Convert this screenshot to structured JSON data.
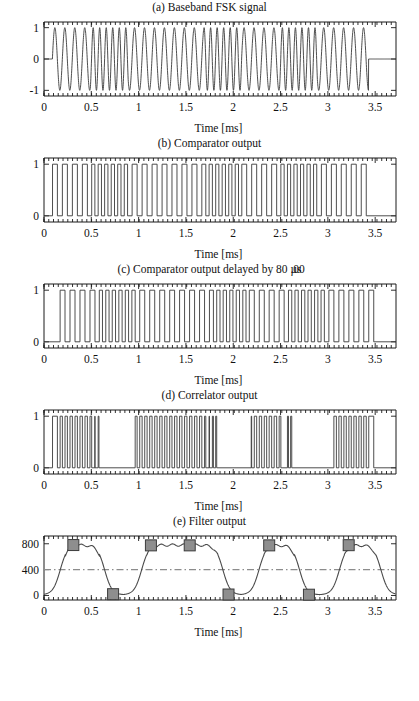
{
  "figure": {
    "xlabel": "Time [ms]",
    "x_ticks": [
      "0",
      "0.5",
      "1",
      "1.5",
      "2",
      "2.5",
      "3",
      "3.5"
    ],
    "x_tick_values": [
      0,
      0.5,
      1,
      1.5,
      2,
      2.5,
      3,
      3.5
    ],
    "x_range": [
      0,
      3.72
    ]
  },
  "panels": {
    "a": {
      "title": "(a) Baseband FSK signal",
      "y_ticks": [
        "1",
        "0",
        "-1"
      ],
      "y_tick_values": [
        1,
        0,
        -1
      ],
      "y_range": [
        -1.18,
        1.18
      ]
    },
    "b": {
      "title": "(b) Comparator output",
      "y_ticks": [
        "1",
        "0"
      ],
      "y_tick_values": [
        1,
        0
      ],
      "y_range": [
        -0.12,
        1.12
      ]
    },
    "c": {
      "title_main": "(c) Comparator output delayed by 80 ",
      "title_overlap_top": "µs",
      "title_overlap_under": ".00",
      "y_ticks": [
        "1",
        "0"
      ],
      "y_tick_values": [
        1,
        0
      ],
      "y_range": [
        -0.12,
        1.12
      ]
    },
    "d": {
      "title": "(d) Correlator output",
      "y_ticks": [
        "1",
        "0"
      ],
      "y_tick_values": [
        1,
        0
      ],
      "y_range": [
        -0.12,
        1.12
      ]
    },
    "e": {
      "title": "(e) Filter output",
      "y_ticks": [
        "800",
        "400",
        "0"
      ],
      "y_tick_values": [
        800,
        400,
        0
      ],
      "y_range": [
        -70,
        920
      ],
      "threshold_value": 400
    }
  },
  "chart_data": {
    "type": "line",
    "xlabel": "Time [ms]",
    "xlim": [
      0,
      3.72
    ],
    "grid": false,
    "legend": "none",
    "symbol_rate_ms": 0.4,
    "signal_start_ms": 0.09,
    "signal_end_ms": 3.43,
    "bit_sequence": [
      1,
      0,
      1,
      1,
      0,
      1,
      0,
      1
    ],
    "freq_low_khz": 9.5,
    "freq_high_khz": 14.5,
    "subplots": [
      {
        "id": "a",
        "name": "Baseband FSK signal",
        "type": "line",
        "ylabel": "",
        "ylim": [
          -1.18,
          1.18
        ],
        "yticks": [
          -1,
          0,
          1
        ],
        "description": "Continuous-phase FSK tone burst, amplitude +/-1, zero outside burst"
      },
      {
        "id": "b",
        "name": "Comparator output",
        "type": "line",
        "ylim": [
          -0.12,
          1.12
        ],
        "yticks": [
          0,
          1
        ],
        "description": "Hard-limited square wave following FSK zero crossings"
      },
      {
        "id": "c",
        "name": "Comparator output delayed by 80 us",
        "type": "line",
        "ylim": [
          -0.12,
          1.12
        ],
        "yticks": [
          0,
          1
        ],
        "delay_us": 80,
        "description": "Same square wave shifted right by 80 microseconds"
      },
      {
        "id": "d",
        "name": "Correlator output",
        "type": "line",
        "ylim": [
          -0.12,
          1.12
        ],
        "yticks": [
          0,
          1
        ],
        "description": "XOR of (b) and (c); dense pulse bursts during some symbols, flat zero during others",
        "burst_intervals_ms": [
          [
            0.09,
            0.58
          ],
          [
            0.95,
            1.83
          ],
          [
            2.19,
            2.64
          ],
          [
            3.04,
            3.5
          ]
        ]
      },
      {
        "id": "e",
        "name": "Filter output",
        "type": "line",
        "ylim": [
          -70,
          920
        ],
        "yticks": [
          0,
          400,
          800
        ],
        "threshold": 400,
        "description": "Low-pass filtered correlator output with decision samples marked",
        "high_level": 790,
        "low_level": 10,
        "sample_markers": [
          {
            "t_ms": 0.31,
            "value": 780
          },
          {
            "t_ms": 0.73,
            "value": 20
          },
          {
            "t_ms": 1.13,
            "value": 775
          },
          {
            "t_ms": 1.54,
            "value": 775
          },
          {
            "t_ms": 1.95,
            "value": 15
          },
          {
            "t_ms": 2.38,
            "value": 775
          },
          {
            "t_ms": 2.8,
            "value": 12
          },
          {
            "t_ms": 3.22,
            "value": 778
          }
        ]
      }
    ]
  }
}
